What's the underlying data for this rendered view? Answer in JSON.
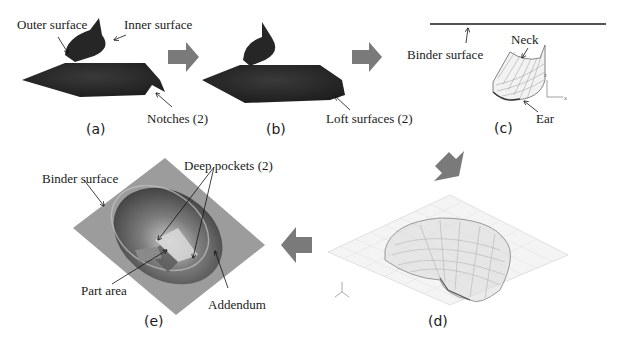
{
  "figure": {
    "panels": [
      {
        "id": "a",
        "caption": "(a)",
        "labels": {
          "outer": "Outer surface",
          "inner": "Inner surface",
          "notches": "Notches (2)"
        }
      },
      {
        "id": "b",
        "caption": "(b)",
        "labels": {
          "loft": "Loft surfaces (2)"
        }
      },
      {
        "id": "c",
        "caption": "(c)",
        "labels": {
          "binder": "Binder surface",
          "neck": "Neck",
          "ear": "Ear"
        },
        "axes": {
          "z": "z",
          "x": "x"
        }
      },
      {
        "id": "d",
        "caption": "(d)"
      },
      {
        "id": "e",
        "caption": "(e)",
        "labels": {
          "binder": "Binder surface",
          "pockets": "Deep pockets (2)",
          "part": "Part area",
          "addendum": "Addendum"
        }
      }
    ],
    "colors": {
      "flow_arrow": "#7a7a7a",
      "dark_part": "#2a2a2a",
      "binder_gray": "#9a9a9a",
      "mesh_line": "#b0b0b0"
    }
  }
}
